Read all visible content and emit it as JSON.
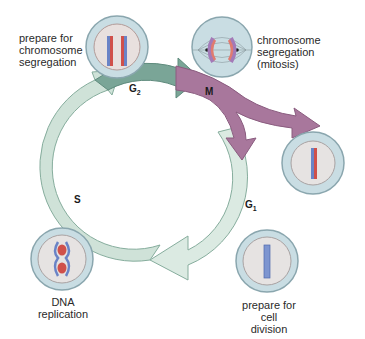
{
  "diagram": {
    "type": "cell-cycle",
    "phases": [
      {
        "id": "G2",
        "label": "G",
        "sub": "2",
        "color": "#7aa597"
      },
      {
        "id": "M",
        "label": "M",
        "sub": "",
        "color": "#a8779c"
      },
      {
        "id": "G1",
        "label": "G",
        "sub": "1",
        "color": "#d9e8e0"
      },
      {
        "id": "S",
        "label": "S",
        "sub": "",
        "color": "#c9ddd2"
      }
    ],
    "cells": [
      {
        "id": "g2-cell",
        "caption": [
          "prepare for",
          "chromosome",
          "segregation"
        ]
      },
      {
        "id": "m-cell",
        "caption": [
          "chromosome",
          "segregation",
          "(mitosis)"
        ]
      },
      {
        "id": "daughter-cell",
        "caption": []
      },
      {
        "id": "g1-cell",
        "caption": [
          "prepare for",
          "cell division"
        ]
      },
      {
        "id": "s-cell",
        "caption": [
          "DNA",
          "replication"
        ]
      }
    ],
    "colors": {
      "cell_outer": "#c9dde3",
      "cell_outer_stroke": "#8aa6ae",
      "cell_inner": "#e6e3e2",
      "cell_inner_stroke": "#a9a2a2",
      "chromosome_red": "#d0504a",
      "chromosome_blue": "#6a83c6",
      "arrow_light": "#d9e9e1",
      "arrow_stroke": "#7ea596",
      "g2_fill": "#7aa597",
      "m_fill": "#a8779c"
    }
  }
}
